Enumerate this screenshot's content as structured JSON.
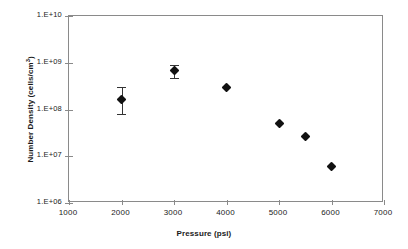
{
  "chart_data": {
    "type": "scatter",
    "title": "",
    "xlabel": "Pressure (psi)",
    "ylabel": "Number Density (cells/cm3)",
    "ylabel_base": "Number Density (cells/cm",
    "ylabel_sup": "3",
    "ylabel_tail": ")",
    "xlim": [
      1000,
      7000
    ],
    "ylim": [
      1000000,
      10000000000
    ],
    "yscale": "log",
    "xscale": "linear",
    "grid": false,
    "legend": null,
    "xticks": [
      1000,
      2000,
      3000,
      4000,
      5000,
      6000,
      7000
    ],
    "xticklabels": [
      "1000",
      "2000",
      "3000",
      "4000",
      "5000",
      "6000",
      "7000"
    ],
    "yticks": [
      1000000,
      10000000,
      100000000,
      1000000000,
      10000000000
    ],
    "yticklabels": [
      "1.E+06",
      "1.E+07",
      "1.E+08",
      "1.E+09",
      "1.E+10"
    ],
    "series": [
      {
        "name": "Number Density",
        "marker": "filled-diamond",
        "color": "#111111",
        "points": [
          {
            "x": 2000,
            "y": 160000000,
            "yerr_low": 80000000,
            "yerr_high": 300000000
          },
          {
            "x": 3000,
            "y": 670000000,
            "yerr_low": 480000000,
            "yerr_high": 900000000
          },
          {
            "x": 4000,
            "y": 300000000,
            "yerr_low": null,
            "yerr_high": null
          },
          {
            "x": 5000,
            "y": 50000000,
            "yerr_low": null,
            "yerr_high": null
          },
          {
            "x": 5500,
            "y": 26000000,
            "yerr_low": null,
            "yerr_high": null
          },
          {
            "x": 6000,
            "y": 6000000,
            "yerr_low": null,
            "yerr_high": null
          }
        ]
      }
    ]
  },
  "colors": {
    "marker": "#111111",
    "axis": "#8a8a8a",
    "text": "#1a1a1a",
    "background": "#ffffff"
  }
}
